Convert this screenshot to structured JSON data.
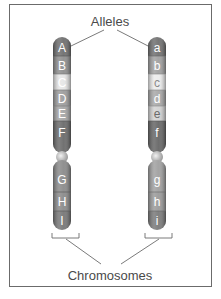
{
  "diagram": {
    "type": "homologous-chromosome-pair",
    "labels": {
      "top": "Alleles",
      "bottom": "Chromosomes"
    },
    "colors": {
      "frame": "#6b6b6b",
      "leader_lines": "#6b6b6b",
      "label_text": "#4a4a4a",
      "band_dark": "#6e6e6e",
      "band_mid": "#9a9a9a",
      "band_light": "#cfcfcf",
      "band_lightest": "#e8e8e8",
      "centromere": "#c8c8c8"
    },
    "chromosomes": [
      {
        "side": "left",
        "bands": [
          {
            "label": "A",
            "shade": "dark"
          },
          {
            "label": "B",
            "shade": "mid"
          },
          {
            "label": "C",
            "shade": "lightest"
          },
          {
            "label": "D",
            "shade": "mid"
          },
          {
            "label": "E",
            "shade": "mid"
          },
          {
            "label": "F",
            "shade": "dark"
          },
          {
            "label": "G",
            "shade": "mid"
          },
          {
            "label": "H",
            "shade": "mid"
          },
          {
            "label": "I",
            "shade": "dark"
          }
        ]
      },
      {
        "side": "right",
        "bands": [
          {
            "label": "a",
            "shade": "dark"
          },
          {
            "label": "b",
            "shade": "mid"
          },
          {
            "label": "c",
            "shade": "lightest"
          },
          {
            "label": "d",
            "shade": "mid"
          },
          {
            "label": "e",
            "shade": "light"
          },
          {
            "label": "f",
            "shade": "dark"
          },
          {
            "label": "g",
            "shade": "mid"
          },
          {
            "label": "h",
            "shade": "mid"
          },
          {
            "label": "i",
            "shade": "dark"
          }
        ]
      }
    ]
  }
}
